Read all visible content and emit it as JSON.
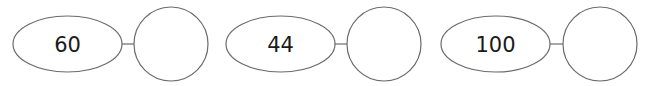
{
  "diagram": {
    "type": "number-bond-pairs",
    "groups": [
      {
        "value": "60",
        "answer": ""
      },
      {
        "value": "44",
        "answer": ""
      },
      {
        "value": "100",
        "answer": ""
      }
    ],
    "colors": {
      "stroke": "#6b6b6b",
      "text": "#1a1a1a",
      "background": "#ffffff"
    }
  }
}
